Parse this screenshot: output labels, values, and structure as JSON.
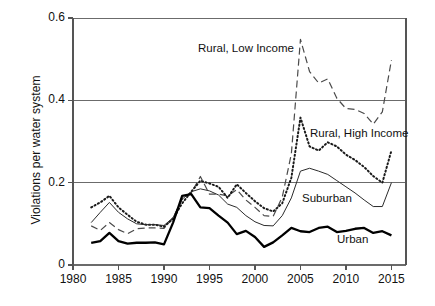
{
  "chart_data": {
    "type": "line",
    "title": "",
    "subtitle": "",
    "xlabel": "",
    "ylabel": "Violations per water system",
    "xlim": [
      1980,
      2016.6
    ],
    "ylim": [
      0,
      0.6
    ],
    "grid": "horizontal gridlines at 0.2, 0.4, 0.6; axis line at 0",
    "x_ticks": [
      1980,
      1985,
      1990,
      1995,
      2000,
      2005,
      2010,
      2015
    ],
    "x_tick_labels": [
      "1980",
      "1985",
      "1990",
      "1995",
      "2000",
      "2005",
      "2010",
      "2015"
    ],
    "y_ticks": [
      0,
      0.2,
      0.4,
      0.6
    ],
    "y_tick_labels": [
      "0",
      "0.2",
      "0.4",
      "0.6"
    ],
    "legend_position": "inline annotations on plot",
    "x": [
      1982,
      1983,
      1984,
      1985,
      1986,
      1987,
      1988,
      1989,
      1990,
      1991,
      1992,
      1993,
      1994,
      1995,
      1996,
      1997,
      1998,
      1999,
      2000,
      2001,
      2002,
      2003,
      2004,
      2005,
      2006,
      2007,
      2008,
      2009,
      2010,
      2011,
      2012,
      2013,
      2014,
      2015
    ],
    "series": [
      {
        "name": "Rural, Low Income",
        "style": "dashed",
        "color": "#4a4a4a",
        "linewidth": 1.2,
        "values": [
          0.095,
          0.084,
          0.103,
          0.086,
          0.076,
          0.088,
          0.09,
          0.09,
          0.089,
          0.115,
          0.16,
          0.175,
          0.215,
          0.172,
          0.172,
          0.168,
          0.183,
          0.158,
          0.14,
          0.12,
          0.118,
          0.165,
          0.27,
          0.548,
          0.47,
          0.442,
          0.452,
          0.405,
          0.38,
          0.378,
          0.368,
          0.342,
          0.372,
          0.498
        ]
      },
      {
        "name": "Rural, High Income",
        "style": "dotted",
        "color": "#1a1a1a",
        "linewidth": 2.0,
        "values": [
          0.14,
          0.152,
          0.168,
          0.14,
          0.122,
          0.105,
          0.098,
          0.098,
          0.093,
          0.112,
          0.15,
          0.178,
          0.205,
          0.198,
          0.19,
          0.163,
          0.196,
          0.175,
          0.155,
          0.138,
          0.13,
          0.15,
          0.212,
          0.358,
          0.288,
          0.278,
          0.298,
          0.288,
          0.268,
          0.255,
          0.238,
          0.216,
          0.2,
          0.278
        ]
      },
      {
        "name": "Suburban",
        "style": "solid-thin",
        "color": "#2b2b2b",
        "linewidth": 1.0,
        "values": [
          0.103,
          0.128,
          0.152,
          0.128,
          0.112,
          0.1,
          0.098,
          0.098,
          0.096,
          0.115,
          0.16,
          0.178,
          0.185,
          0.18,
          0.17,
          0.148,
          0.14,
          0.12,
          0.105,
          0.096,
          0.095,
          0.12,
          0.163,
          0.228,
          0.235,
          0.228,
          0.22,
          0.205,
          0.19,
          0.175,
          0.158,
          0.142,
          0.142,
          0.2
        ]
      },
      {
        "name": "Urban",
        "style": "solid-thick",
        "color": "#000000",
        "linewidth": 2.3,
        "values": [
          0.054,
          0.058,
          0.078,
          0.058,
          0.052,
          0.054,
          0.054,
          0.055,
          0.05,
          0.103,
          0.168,
          0.172,
          0.14,
          0.138,
          0.12,
          0.103,
          0.075,
          0.083,
          0.068,
          0.044,
          0.055,
          0.072,
          0.09,
          0.082,
          0.08,
          0.09,
          0.093,
          0.08,
          0.083,
          0.088,
          0.09,
          0.078,
          0.082,
          0.072
        ]
      }
    ],
    "annotations": [
      {
        "text": "Rural, Low Income",
        "x_px": 198,
        "y_px": 42
      },
      {
        "text": "Rural, High Income",
        "x_px": 310,
        "y_px": 127
      },
      {
        "text": "Suburban",
        "x_px": 302,
        "y_px": 192
      },
      {
        "text": "Urban",
        "x_px": 337,
        "y_px": 233
      }
    ],
    "colors": {
      "axis": "#555555",
      "grid": "#6b6b6b",
      "background": "#ffffff"
    }
  }
}
